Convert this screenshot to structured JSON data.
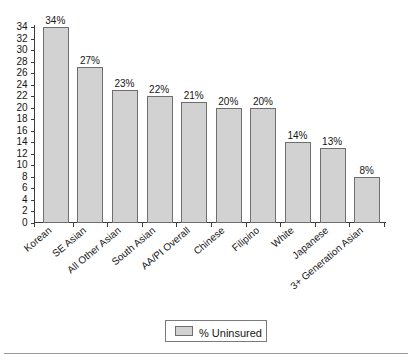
{
  "chart_data": {
    "type": "bar",
    "title": "",
    "subtitle": "",
    "xlabel": "",
    "ylabel": "",
    "categories": [
      "Korean",
      "SE Asian",
      "All Other Asian",
      "South Asian",
      "AA/PI Overall",
      "Chinese",
      "Filipino",
      "White",
      "Japanese",
      "3+ Generation Asian"
    ],
    "values": [
      34,
      27,
      23,
      22,
      21,
      20,
      20,
      14,
      13,
      8
    ],
    "data_labels": [
      "34%",
      "27%",
      "23%",
      "22%",
      "21%",
      "20%",
      "20%",
      "14%",
      "13%",
      "8%"
    ],
    "series": [
      {
        "name": "% Uninsured",
        "values": [
          34,
          27,
          23,
          22,
          21,
          20,
          20,
          14,
          13,
          8
        ]
      }
    ],
    "ylim": [
      0,
      34
    ],
    "ytick_step": 2,
    "ytick_labels": [
      "0",
      "2",
      "4",
      "6",
      "8",
      "10",
      "12",
      "14",
      "16",
      "18",
      "20",
      "22",
      "24",
      "26",
      "28",
      "30",
      "32",
      "34"
    ],
    "grid": false,
    "legend": {
      "position": "bottom",
      "entries": [
        {
          "label": "% Uninsured",
          "color": "#d2d2d2"
        }
      ]
    },
    "colors": {
      "bar_fill": "#d2d2d2",
      "bar_stroke": "#6e6e6e",
      "axis": "#3c3c3c",
      "text": "#141414",
      "background": "#ffffff"
    }
  }
}
